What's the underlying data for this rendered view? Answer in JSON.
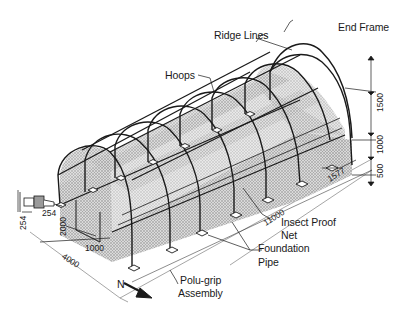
{
  "diagram": {
    "labels": {
      "end_frame": "End Frame",
      "ridge_lines": "Ridge Lines",
      "hoops": "Hoops",
      "insect_proof_net_line1": "Insect Proof",
      "insect_proof_net_line2": "Net",
      "foundation_pipe_line1": "Foundation",
      "foundation_pipe_line2": "Pipe",
      "polu_grip_line1": "Polu-grip",
      "polu_grip_line2": "Assembly",
      "north": "N"
    },
    "dimensions": {
      "arch_height": "1500",
      "wall_height": "1000",
      "foundation_depth": "500",
      "hoop_spacing": "1577",
      "length": "11000",
      "width": "4000",
      "door_width": "1000",
      "door_height": "2000",
      "pump_width": "254",
      "pump_height": "254"
    },
    "colors": {
      "line": "#1a1a1a",
      "net_fill": "#bdbdbd",
      "background": "#ffffff"
    }
  }
}
